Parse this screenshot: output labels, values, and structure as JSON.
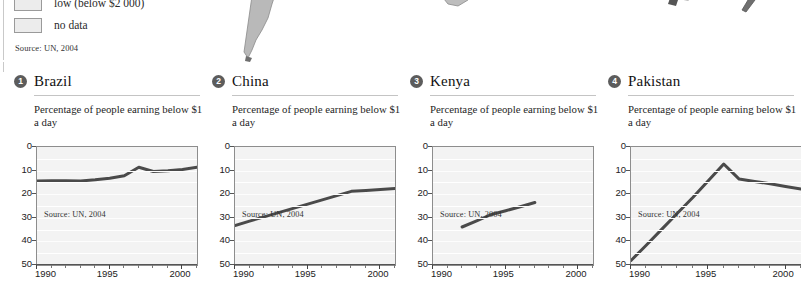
{
  "legend": {
    "items": [
      {
        "swatch_color": "#ececec",
        "label": "low (below $2 000)"
      },
      {
        "swatch_color": "#ececec",
        "label": "no data"
      }
    ],
    "source": "Source: UN, 2004"
  },
  "maps": {
    "fragments": [
      {
        "name": "south-america-fragment",
        "fill": "#b9b9b9"
      },
      {
        "name": "southern-africa-fragment",
        "fill": "#bdbdbd"
      },
      {
        "name": "australia-fragment",
        "fill": "#6f6f6f"
      },
      {
        "name": "new-zealand-fragment",
        "fill": "#6f6f6f"
      }
    ]
  },
  "panels": [
    {
      "number": "1",
      "country": "Brazil",
      "subtitle": "Percentage of people earning below $1 a day",
      "source": "Source: UN, 2004"
    },
    {
      "number": "2",
      "country": "China",
      "subtitle": "Percentage of people earning below $1 a day",
      "source": "Source: UN, 2004"
    },
    {
      "number": "3",
      "country": "Kenya",
      "subtitle": "Percentage of people earning below $1 a day",
      "source": "Source: UN, 2004"
    },
    {
      "number": "4",
      "country": "Pakistan",
      "subtitle": "Percentage of people earning below $1 a day",
      "source": "Source: UN, 2004"
    }
  ],
  "axis": {
    "y_ticks": [
      "0",
      "10",
      "20",
      "30",
      "40",
      "50"
    ],
    "x_ticks": [
      "1990",
      "1995",
      "2000"
    ],
    "y_label_values": [
      0,
      10,
      20,
      30,
      40,
      50
    ],
    "x_label_values": [
      1990,
      1995,
      2000
    ]
  },
  "chart_data": [
    {
      "type": "line",
      "title": "Brazil",
      "subtitle": "Percentage of people earning below $1 a day",
      "xlabel": "",
      "ylabel": "Percentage of people earning below $1 a day",
      "xlim": [
        1990,
        2001
      ],
      "ylim": [
        0,
        50
      ],
      "y_inverted": true,
      "grid": true,
      "legend": "none",
      "line_color": "#4a4a4a",
      "x": [
        1990,
        1991,
        1992,
        1993,
        1994,
        1995,
        1996,
        1997,
        1998,
        1999,
        2000,
        2001
      ],
      "values": [
        14.4,
        14.3,
        14.3,
        14.4,
        13.9,
        13.2,
        12.2,
        8.6,
        10.4,
        10.1,
        9.5,
        8.6
      ]
    },
    {
      "type": "line",
      "title": "China",
      "subtitle": "Percentage of people earning below $1 a day",
      "xlabel": "",
      "ylabel": "Percentage of people earning below $1 a day",
      "xlim": [
        1990,
        2001
      ],
      "ylim": [
        0,
        50
      ],
      "y_inverted": true,
      "grid": true,
      "legend": "none",
      "line_color": "#4a4a4a",
      "x": [
        1990,
        1991,
        1992,
        1993,
        1994,
        1995,
        1996,
        1997,
        1998,
        1999,
        2000,
        2001
      ],
      "values": [
        33.3,
        31.4,
        29.6,
        27.8,
        26.0,
        24.2,
        22.4,
        20.6,
        18.8,
        18.4,
        18.0,
        17.6
      ]
    },
    {
      "type": "line",
      "title": "Kenya",
      "subtitle": "Percentage of people earning below $1 a day",
      "xlabel": "",
      "ylabel": "Percentage of people earning below $1 a day",
      "xlim": [
        1990,
        2001
      ],
      "ylim": [
        0,
        50
      ],
      "y_inverted": true,
      "grid": true,
      "legend": "none",
      "line_color": "#4a4a4a",
      "x": [
        1992,
        1993,
        1994,
        1995,
        1996,
        1997
      ],
      "values": [
        33.9,
        31.3,
        28.6,
        27.0,
        25.3,
        23.5
      ]
    },
    {
      "type": "line",
      "title": "Pakistan",
      "subtitle": "Percentage of people earning below $1 a day",
      "xlabel": "",
      "ylabel": "Percentage of people earning below $1 a day",
      "xlim": [
        1990,
        2001
      ],
      "ylim": [
        0,
        50
      ],
      "y_inverted": true,
      "grid": true,
      "legend": "none",
      "line_color": "#4a4a4a",
      "x": [
        1990,
        1991,
        1992,
        1993,
        1994,
        1995,
        1996,
        1997,
        1998,
        1999,
        2000,
        2001
      ],
      "values": [
        48.1,
        41.5,
        34.8,
        28.1,
        21.4,
        14.3,
        7.2,
        13.6,
        14.6,
        15.6,
        16.7,
        17.8
      ]
    }
  ],
  "colors": {
    "line": "#4a4a4a",
    "plot_background": "#f3f3f3",
    "grid": "#ffffff",
    "axis": "#555555",
    "badge": "#5c5c5c",
    "rule": "#c4c4c4"
  }
}
